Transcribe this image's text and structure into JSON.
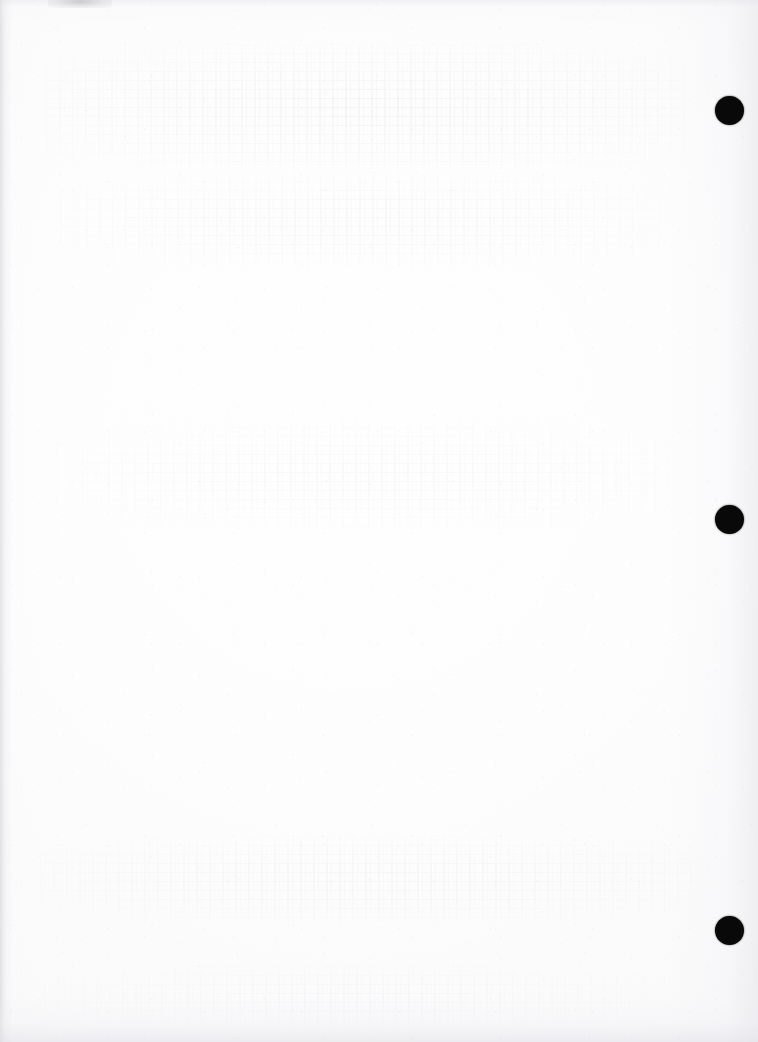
{
  "page": {
    "kind": "scanned-document-page",
    "width": 758,
    "height": 1042,
    "paper_color": "#fbfbfc",
    "edge_shadow_color": "#cdcdd2",
    "content_text": "",
    "note": "Reverse side of a printed sheet: no legible printed text, only faint bleed-through ghosting and scanner grain."
  },
  "registration_marks": {
    "count": 3,
    "color": "#090909",
    "diameter": 29,
    "items": [
      {
        "label": "registration-mark-top",
        "x": 729,
        "y": 110
      },
      {
        "label": "registration-mark-middle",
        "x": 729,
        "y": 519
      },
      {
        "label": "registration-mark-bottom",
        "x": 729,
        "y": 930
      }
    ]
  },
  "artifacts": {
    "top_edge_smudge": {
      "x": 48,
      "y": 0,
      "width": 64,
      "height": 8
    },
    "ghost_bleed_regions": [
      {
        "label": "ghost-upper",
        "x": 46,
        "y": 44,
        "width": 640,
        "height": 126
      },
      {
        "label": "ghost-upper-second",
        "x": 60,
        "y": 172,
        "width": 600,
        "height": 96
      },
      {
        "label": "ghost-middle",
        "x": 56,
        "y": 418,
        "width": 620,
        "height": 112
      },
      {
        "label": "ghost-lower",
        "x": 40,
        "y": 836,
        "width": 660,
        "height": 86
      },
      {
        "label": "ghost-footer",
        "x": 44,
        "y": 966,
        "width": 620,
        "height": 60
      }
    ]
  }
}
